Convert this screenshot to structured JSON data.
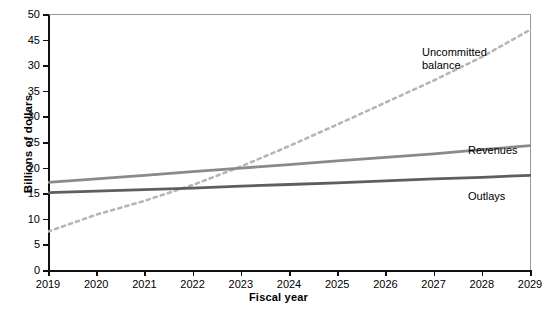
{
  "chart_data": {
    "type": "line",
    "title": "",
    "subtitle": "",
    "xlabel": "Fiscal year",
    "ylabel": "Billions of dollars",
    "x": [
      2019,
      2020,
      2021,
      2022,
      2023,
      2024,
      2025,
      2026,
      2027,
      2028,
      2029
    ],
    "xtick_labels": [
      "2019",
      "2020",
      "2021",
      "2022",
      "2023",
      "2024",
      "2025",
      "2026",
      "2027",
      "2028",
      "2029"
    ],
    "ytick_values": [
      0,
      5,
      10,
      15,
      20,
      25,
      30,
      35,
      40,
      45,
      50
    ],
    "ytick_labels": [
      "0",
      "5",
      "10",
      "15",
      "20",
      "25",
      "30",
      "35",
      "30",
      "45",
      "50"
    ],
    "xlim": [
      2019,
      2029
    ],
    "ylim": [
      0,
      50
    ],
    "grid": false,
    "legend": "inline-annotations",
    "series": [
      {
        "name": "Uncommitted balance",
        "style": "dotted",
        "color": "#b6b6b6",
        "label_text": "Uncommitted\nbalance",
        "values": [
          7.5,
          10.8,
          13.5,
          16.6,
          20.2,
          24.2,
          28.4,
          32.7,
          37.0,
          41.6,
          46.9
        ]
      },
      {
        "name": "Revenues",
        "style": "solid",
        "color": "#8a8a8a",
        "label_text": "Revenues",
        "values": [
          17.1,
          17.8,
          18.5,
          19.2,
          19.9,
          20.6,
          21.3,
          22.0,
          22.7,
          23.5,
          24.3
        ]
      },
      {
        "name": "Outlays",
        "style": "solid",
        "color": "#5e5e5e",
        "label_text": "Outlays",
        "values": [
          15.1,
          15.4,
          15.7,
          16.0,
          16.4,
          16.7,
          17.0,
          17.4,
          17.8,
          18.1,
          18.5
        ]
      }
    ]
  },
  "colors": {
    "axis": "#111111",
    "frame_light": "#9a9a9a",
    "background": "#ffffff",
    "uncommitted": "#b6b6b6",
    "revenues": "#8a8a8a",
    "outlays": "#5e5e5e"
  }
}
